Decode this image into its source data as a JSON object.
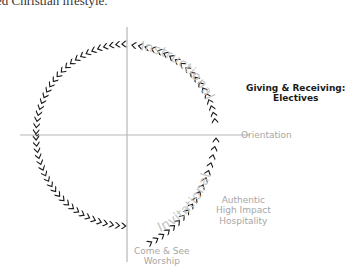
{
  "caption": "ed Christian lifestyle.",
  "diagram": {
    "title": "",
    "axes": {
      "vertical_color": "#b0b0b0",
      "horizontal_color": "#b0b0b0"
    },
    "arc_labels": {
      "instructional": "Instructional",
      "invitational": "Invitational"
    },
    "stage_labels": {
      "giving_line1": "Giving & Receiving:",
      "giving_line2": "Electives",
      "orientation": "Orientation",
      "authentic_line1": "Authentic",
      "authentic_line2": "High Impact",
      "authentic_line3": "Hospitality",
      "come_line1": "Come & See",
      "come_line2": "Worship"
    },
    "colors": {
      "chevron": "#1a1a1a",
      "muted_text": "#a6a6a6",
      "emphasis_text": "#1a1a1a"
    },
    "chevron_icon": "chevron-arrow-icon"
  }
}
